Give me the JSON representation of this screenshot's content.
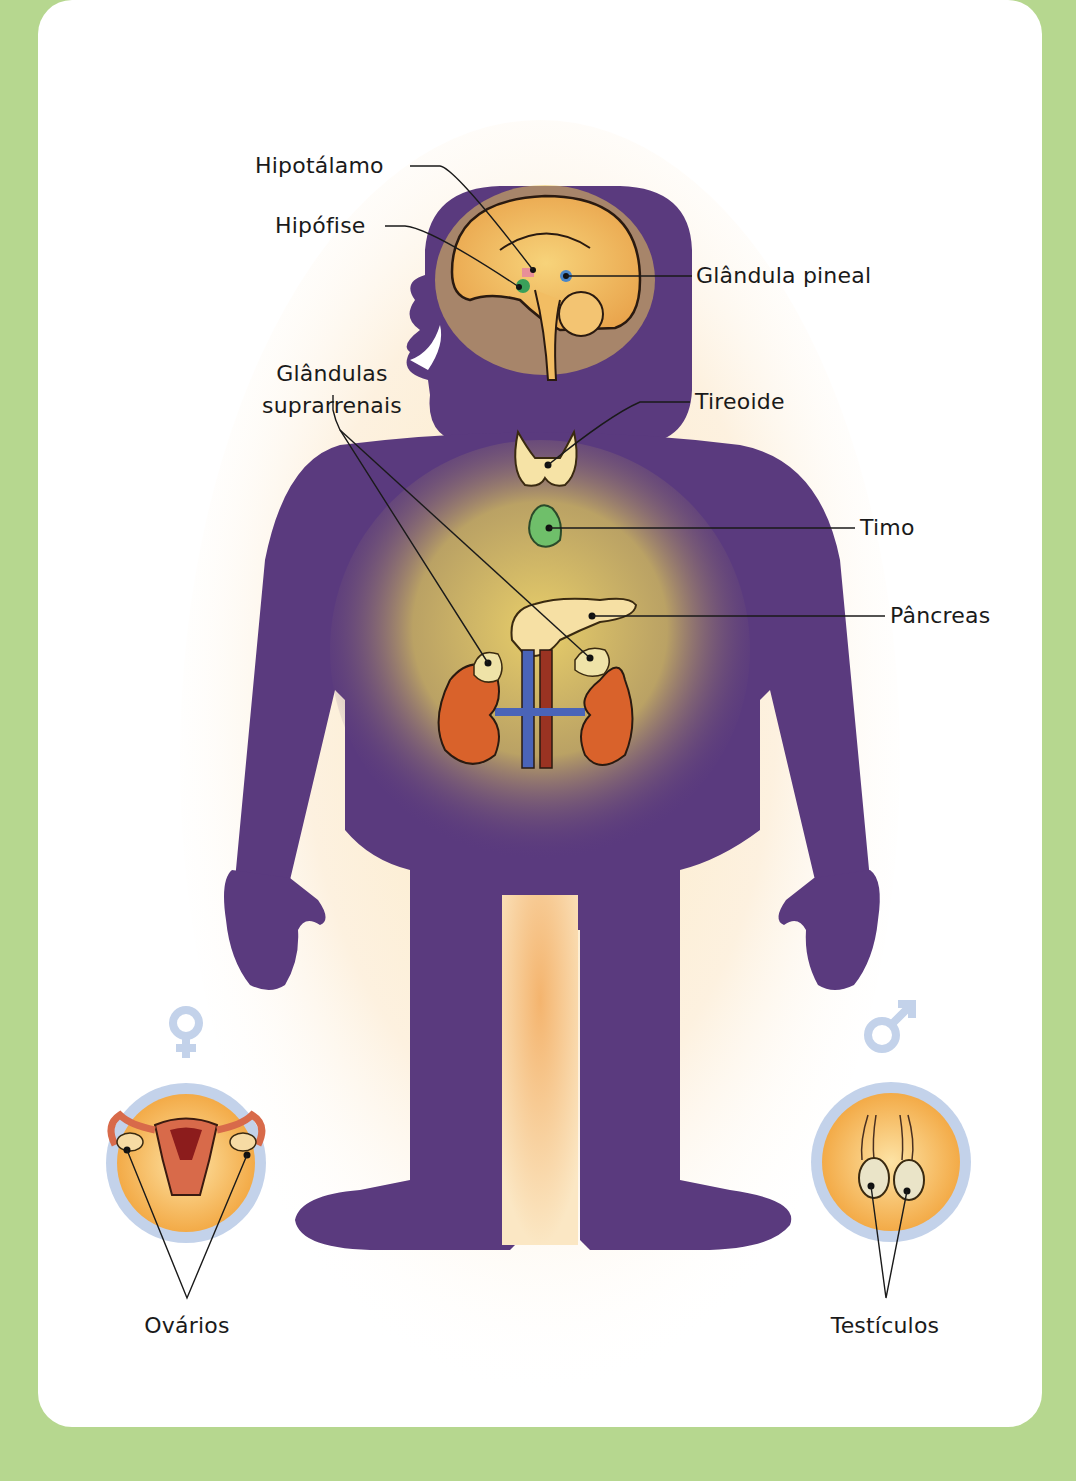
{
  "diagram": {
    "title": "",
    "colors": {
      "background": "#b6d78f",
      "card": "#ffffff",
      "body_silhouette": "#5a3a7e",
      "inner_glow": "#f3cf6a",
      "gender_symbol": "#c3d2ea",
      "kidney": "#d9622b",
      "thymus": "#6fbf6a",
      "vein": "#4a64b8",
      "artery": "#9a3322"
    },
    "labels": [
      {
        "id": "hipotalamo",
        "text": "Hipotálamo"
      },
      {
        "id": "hipofise",
        "text": "Hipófise"
      },
      {
        "id": "glandula_pineal",
        "text": "Glândula pineal"
      },
      {
        "id": "glandulas_suprarrenais_1",
        "text": "Glândulas"
      },
      {
        "id": "glandulas_suprarrenais_2",
        "text": "suprarrenais"
      },
      {
        "id": "tireoide",
        "text": "Tireoide"
      },
      {
        "id": "timo",
        "text": "Timo"
      },
      {
        "id": "pancreas",
        "text": "Pâncreas"
      },
      {
        "id": "ovarios",
        "text": "Ovários"
      },
      {
        "id": "testiculos",
        "text": "Testículos"
      }
    ],
    "symbols": {
      "female": "female-symbol",
      "male": "male-symbol"
    }
  }
}
